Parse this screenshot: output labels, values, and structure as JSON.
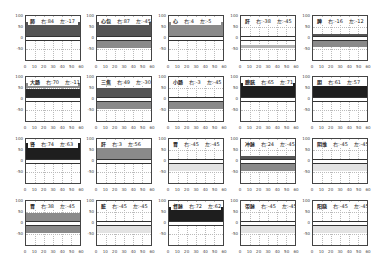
{
  "chart_data": {
    "type": "area",
    "layout": {
      "rows": 4,
      "cols": 5,
      "grid": true
    },
    "xlim": [
      0,
      60
    ],
    "ylim": [
      -100,
      100
    ],
    "xticks": [
      "0",
      "10",
      "20",
      "30",
      "40",
      "50",
      "60"
    ],
    "yticks": [
      "100",
      "50",
      "0",
      "-50"
    ],
    "panels": [
      {
        "name": "肺",
        "right": "右:84",
        "left": "左:-17",
        "bands": [
          {
            "from": 5,
            "to": 75,
            "color": "#555555"
          }
        ]
      },
      {
        "name": "心包",
        "right": "右:87",
        "left": "左:-45",
        "bands": [
          {
            "from": 5,
            "to": 75,
            "color": "#555555"
          },
          {
            "from": -45,
            "to": -5,
            "color": "#8a8a8a"
          }
        ]
      },
      {
        "name": "心",
        "right": "右:4",
        "left": "左:-5",
        "bands": [
          {
            "from": 5,
            "to": 75,
            "color": "#8a8a8a"
          }
        ]
      },
      {
        "name": "肝",
        "right": "右:-38",
        "left": "左:-45",
        "bands": [
          {
            "from": -45,
            "to": -30,
            "color": "#b5b5b5"
          }
        ]
      },
      {
        "name": "脾",
        "right": "右:-16",
        "left": "左:-12",
        "bands": [
          {
            "from": 5,
            "to": 20,
            "color": "#555555"
          },
          {
            "from": -40,
            "to": -15,
            "color": "#8a8a8a"
          }
        ]
      },
      {
        "name": "大肠",
        "right": "右:70",
        "left": "左:-11",
        "bands": [
          {
            "from": 50,
            "to": 75,
            "color": "#8a8a8a"
          },
          {
            "from": 5,
            "to": 45,
            "color": "#2a2a2a"
          }
        ]
      },
      {
        "name": "三焦",
        "right": "右:49",
        "left": "左:-30",
        "bands": [
          {
            "from": 5,
            "to": 50,
            "color": "#555555"
          },
          {
            "from": -45,
            "to": -5,
            "color": "#8a8a8a"
          }
        ]
      },
      {
        "name": "小肠",
        "right": "右:-3",
        "left": "左:-45",
        "bands": [
          {
            "from": -45,
            "to": -5,
            "color": "#8a8a8a"
          }
        ]
      },
      {
        "name": "膀胱",
        "right": "右:65",
        "left": "左:71",
        "bands": [
          {
            "from": 5,
            "to": 75,
            "color": "#1e1e1e"
          }
        ]
      },
      {
        "name": "胆",
        "right": "右:61",
        "left": "左:57",
        "bands": [
          {
            "from": 5,
            "to": 60,
            "color": "#1e1e1e"
          }
        ]
      },
      {
        "name": "肾",
        "right": "右:74",
        "left": "左:63",
        "bands": [
          {
            "from": 5,
            "to": 80,
            "color": "#1e1e1e"
          }
        ]
      },
      {
        "name": "肝",
        "right": "右:3",
        "left": "左:56",
        "bands": [
          {
            "from": 5,
            "to": 60,
            "color": "#8a8a8a"
          }
        ]
      },
      {
        "name": "胃",
        "right": "右:-45",
        "left": "左:-45",
        "bands": [
          {
            "from": -45,
            "to": -5,
            "color": "#e3e3e3"
          }
        ]
      },
      {
        "name": "冲脉",
        "right": "右:24",
        "left": "左:-45",
        "bands": [
          {
            "from": 5,
            "to": 25,
            "color": "#555555"
          },
          {
            "from": -45,
            "to": -5,
            "color": "#8a8a8a"
          }
        ]
      },
      {
        "name": "阴维",
        "right": "右:-45",
        "left": "左:-45",
        "bands": [
          {
            "from": -45,
            "to": -5,
            "color": "#e3e3e3"
          }
        ]
      },
      {
        "name": "胃",
        "right": "右:38",
        "left": "左:-45",
        "bands": [
          {
            "from": 5,
            "to": 45,
            "color": "#8a8a8a"
          },
          {
            "from": -45,
            "to": -5,
            "color": "#8a8a8a"
          }
        ]
      },
      {
        "name": "脏",
        "right": "右:-45",
        "left": "左:-45",
        "bands": [
          {
            "from": -45,
            "to": -5,
            "color": "#e3e3e3"
          }
        ]
      },
      {
        "name": "督脉",
        "right": "右:72",
        "left": "左:62",
        "bands": [
          {
            "from": 5,
            "to": 75,
            "color": "#1e1e1e"
          }
        ]
      },
      {
        "name": "带脉",
        "right": "右:-45",
        "left": "左:-45",
        "bands": [
          {
            "from": -45,
            "to": -5,
            "color": "#e3e3e3"
          }
        ]
      },
      {
        "name": "阳跷",
        "right": "右:-45",
        "left": "左:-45",
        "bands": [
          {
            "from": -45,
            "to": -5,
            "color": "#e3e3e3"
          }
        ]
      }
    ]
  }
}
